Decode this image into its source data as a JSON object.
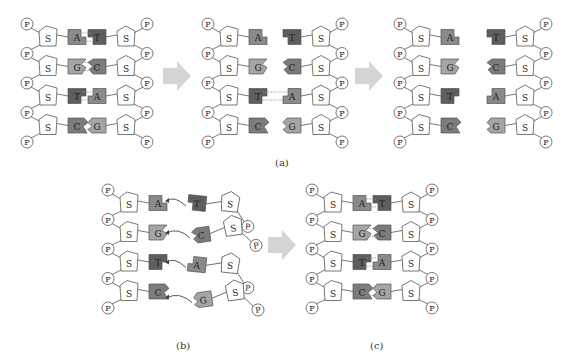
{
  "figure": {
    "colors": {
      "A": "#8a8a8a",
      "T": "#5e5e5e",
      "G": "#a5a5a5",
      "C": "#7c7c7c",
      "stroke": "#555555",
      "sugar_fill": "#ffffff",
      "phosphate_fill": "#ffffff",
      "arrow": "#d4d4d4",
      "bond": "#888888",
      "curve_arrow": "#444444"
    },
    "labels": {
      "phosphate": "P",
      "sugar": "S"
    },
    "captions": {
      "a": "(a)",
      "b": "(b)",
      "c": "(c)"
    },
    "panels": [
      {
        "id": "a1",
        "kind": "paired",
        "x0": 27,
        "y0": 24,
        "pairs": [
          [
            "A",
            "T"
          ],
          [
            "G",
            "C"
          ],
          [
            "T",
            "A"
          ],
          [
            "C",
            "G"
          ]
        ],
        "gap": 0,
        "bonds": true
      },
      {
        "id": "a2",
        "kind": "paired",
        "x0": 208,
        "y0": 24,
        "pairs": [
          [
            "A",
            "T"
          ],
          [
            "G",
            "C"
          ],
          [
            "T",
            "A"
          ],
          [
            "C",
            "G"
          ]
        ],
        "gap": 14,
        "bonds": [
          false,
          false,
          true,
          false
        ],
        "separated": [
          true,
          true,
          false,
          false
        ]
      },
      {
        "id": "a3",
        "kind": "paired",
        "x0": 400,
        "y0": 24,
        "pairs": [
          [
            "A",
            "T"
          ],
          [
            "G",
            "C"
          ],
          [
            "T",
            "A"
          ],
          [
            "C",
            "G"
          ]
        ],
        "gap": 26,
        "bonds": false,
        "separated": [
          true,
          true,
          true,
          true
        ]
      },
      {
        "id": "b",
        "kind": "incoming",
        "x0": 108,
        "y0": 190,
        "left": [
          "A",
          "G",
          "T",
          "C"
        ],
        "right": [
          "T",
          "C",
          "A",
          "G"
        ]
      },
      {
        "id": "c",
        "kind": "paired",
        "x0": 312,
        "y0": 190,
        "pairs": [
          [
            "A",
            "T"
          ],
          [
            "G",
            "C"
          ],
          [
            "T",
            "A"
          ],
          [
            "C",
            "G"
          ]
        ],
        "gap": 0,
        "bonds": true
      }
    ],
    "arrows": [
      {
        "x": 163,
        "y": 76
      },
      {
        "x": 355,
        "y": 76
      },
      {
        "x": 268,
        "y": 245
      }
    ]
  }
}
